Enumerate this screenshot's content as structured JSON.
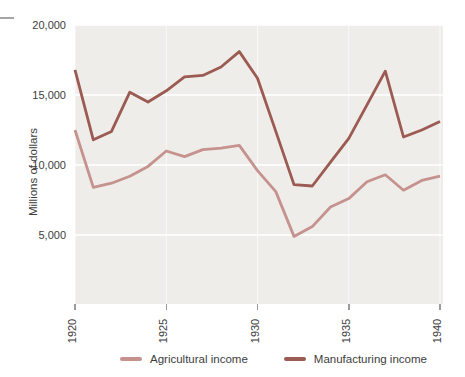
{
  "figure": {
    "y_axis_title": "Millions of dollars",
    "y_ticks": [
      {
        "label": "20,000",
        "value": 20000
      },
      {
        "label": "15,000",
        "value": 15000
      },
      {
        "label": "10,000",
        "value": 10000
      },
      {
        "label": "5,000",
        "value": 5000
      }
    ],
    "x_ticks": [
      {
        "label": "1920",
        "value": 1920
      },
      {
        "label": "1925",
        "value": 1925
      },
      {
        "label": "1930",
        "value": 1930
      },
      {
        "label": "1935",
        "value": 1935
      },
      {
        "label": "1940",
        "value": 1940
      }
    ],
    "legend": [
      {
        "label": "Agricultural income",
        "color": "#c5928e"
      },
      {
        "label": "Manufacturing income",
        "color": "#9b5a52"
      }
    ]
  },
  "colors": {
    "page_background": "#ffffff",
    "panel_background": "#efedea",
    "gridline": "#ffffff",
    "agricultural_line": "#c5928e",
    "manufacturing_line": "#9b5a52",
    "text": "#3d3d3d",
    "tick_mark": "#9a9a9a",
    "artifact_line": "#a5a5a5"
  },
  "chart_data": {
    "type": "line",
    "title": "",
    "xlabel": "",
    "ylabel": "Millions of dollars",
    "x": [
      1920,
      1921,
      1922,
      1923,
      1924,
      1925,
      1926,
      1927,
      1928,
      1929,
      1930,
      1931,
      1932,
      1933,
      1934,
      1935,
      1936,
      1937,
      1938,
      1939,
      1940
    ],
    "series": [
      {
        "name": "Agricultural income",
        "color": "#c5928e",
        "values": [
          12500,
          8400,
          8700,
          9200,
          9900,
          11000,
          10600,
          11100,
          11200,
          11400,
          9600,
          8100,
          4900,
          5600,
          7000,
          7600,
          8800,
          9300,
          8200,
          8900,
          9200
        ]
      },
      {
        "name": "Manufacturing income",
        "color": "#9b5a52",
        "values": [
          16800,
          11800,
          12400,
          15200,
          14500,
          15300,
          16300,
          16400,
          17000,
          18100,
          16200,
          12400,
          8600,
          8500,
          10200,
          11900,
          14300,
          16700,
          12000,
          12500,
          13100
        ]
      }
    ],
    "xlim": [
      1920,
      1940
    ],
    "ylim": [
      0,
      20000
    ],
    "grid": "horizontal-and-vertical-white-gridlines",
    "legend_position": "bottom"
  }
}
